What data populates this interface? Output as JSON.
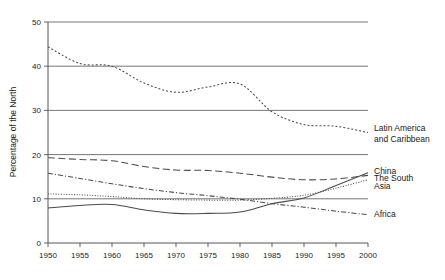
{
  "chart_data": {
    "type": "line",
    "title": "",
    "xlabel": "",
    "ylabel": "Percentage of the North",
    "xlim": [
      1950,
      2000
    ],
    "ylim": [
      0,
      50
    ],
    "grid": true,
    "legend_position": "right-inline",
    "xticks": [
      1950,
      1955,
      1960,
      1965,
      1970,
      1975,
      1980,
      1985,
      1990,
      1995,
      2000
    ],
    "yticks": [
      0,
      10,
      20,
      30,
      40,
      50
    ],
    "x": [
      1950,
      1955,
      1960,
      1965,
      1970,
      1975,
      1980,
      1985,
      1990,
      1995,
      2000
    ],
    "series": [
      {
        "name": "Latin America and Caribbean",
        "label_line1": "Latin America",
        "label_line2": "and Caribbean",
        "linestyle": "dotted",
        "dasharray": "2,2",
        "values": [
          44.4,
          40.6,
          40.0,
          36.2,
          34.1,
          35.3,
          36.0,
          29.7,
          26.8,
          26.4,
          25.0
        ],
        "label_y": 26.0
      },
      {
        "name": "The South",
        "label_line1": "The South",
        "linestyle": "long-dash",
        "dasharray": "7,3.5",
        "values": [
          19.3,
          18.9,
          18.6,
          17.3,
          16.5,
          16.4,
          15.8,
          14.9,
          14.3,
          14.5,
          15.3
        ],
        "label_y": 14.6
      },
      {
        "name": "China",
        "label_line1": "China",
        "linestyle": "solid",
        "dasharray": "none",
        "values": [
          7.9,
          8.5,
          8.7,
          7.5,
          6.7,
          6.7,
          7.0,
          8.9,
          10.2,
          13.0,
          15.9
        ],
        "label_y": 16.3
      },
      {
        "name": "Asia",
        "label_line1": "Asia",
        "linestyle": "fine-dotted",
        "dasharray": "1,1.6",
        "values": [
          11.1,
          10.9,
          10.5,
          10.0,
          9.8,
          9.7,
          9.7,
          10.1,
          10.8,
          12.4,
          14.3
        ],
        "label_y": 12.9
      },
      {
        "name": "Africa",
        "label_line1": "Africa",
        "linestyle": "dash-dot",
        "dasharray": "5,2,1.2,2",
        "values": [
          15.8,
          14.6,
          13.4,
          12.3,
          11.4,
          10.7,
          9.9,
          8.9,
          8.1,
          7.2,
          6.4
        ],
        "label_y": 6.5
      }
    ]
  },
  "axis": {
    "ylabel": "Percentage of the North",
    "ytick_labels": [
      "0",
      "10",
      "20",
      "30",
      "40",
      "50"
    ],
    "xtick_labels": [
      "1950",
      "1955",
      "1960",
      "1965",
      "1970",
      "1975",
      "1980",
      "1985",
      "1990",
      "1995",
      "2000"
    ]
  }
}
